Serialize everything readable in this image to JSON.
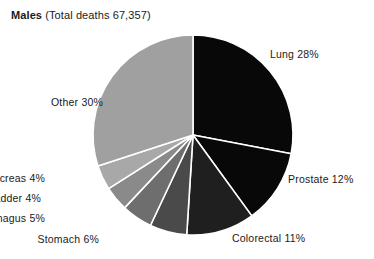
{
  "title": {
    "bold_part": "Males",
    "rest_part": " (Total deaths 67,357)"
  },
  "chart_data": {
    "type": "pie",
    "title": "Males (Total deaths 67,357)",
    "subtitle": "",
    "total_deaths": "67,357",
    "total_deaths_numeric": 67357,
    "unit": "%",
    "start_angle_deg": 0,
    "direction": "clockwise",
    "legend": "none (direct slice labels)",
    "grid": false,
    "separator_color": "#ffffff",
    "categories": [
      "Lung",
      "Prostate",
      "Colorectal",
      "Stomach",
      "Oesophagus",
      "Bladder",
      "Pancreas",
      "Other"
    ],
    "values": [
      28,
      12,
      11,
      6,
      5,
      4,
      4,
      30
    ],
    "slices": [
      {
        "label": "Lung",
        "value": 28,
        "label_text": "Lung  28%",
        "color": "#080808",
        "side": "right"
      },
      {
        "label": "Prostate",
        "value": 12,
        "label_text": "Prostate  12%",
        "color": "#080808",
        "side": "right"
      },
      {
        "label": "Colorectal",
        "value": 11,
        "label_text": "Colorectal  11%",
        "color": "#1f1f1f",
        "side": "right"
      },
      {
        "label": "Stomach",
        "value": 6,
        "label_text": "Stomach  6%",
        "color": "#4a4a4a",
        "side": "left"
      },
      {
        "label": "Oesophagus",
        "value": 5,
        "label_text": "Oesophagus  5%",
        "color": "#6e6e6e",
        "side": "left"
      },
      {
        "label": "Bladder",
        "value": 4,
        "label_text": "Bladder  4%",
        "color": "#8a8a8a",
        "side": "left"
      },
      {
        "label": "Pancreas",
        "value": 4,
        "label_text": "Pancreas  4%",
        "color": "#a8a8a8",
        "side": "left"
      },
      {
        "label": "Other",
        "value": 30,
        "label_text": "Other  30%",
        "color": "#a0a0a0",
        "side": "left"
      }
    ]
  }
}
